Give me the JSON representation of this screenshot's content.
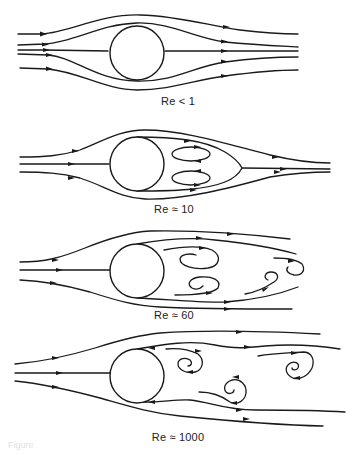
{
  "figure": {
    "panels": [
      {
        "id": "re-lt-1",
        "label": "Re < 1",
        "regime": "creeping flow, symmetric streamlines"
      },
      {
        "id": "re-10",
        "label": "Re ≈ 10",
        "regime": "attached pair of steady recirculating eddies"
      },
      {
        "id": "re-60",
        "label": "Re ≈ 60",
        "regime": "vortex street shedding"
      },
      {
        "id": "re-1000",
        "label": "Re ≈ 1000",
        "regime": "turbulent wake with vortices"
      }
    ],
    "caption": "Figure",
    "colors": {
      "ink": "#1a1a1a",
      "background": "#ffffff"
    }
  }
}
